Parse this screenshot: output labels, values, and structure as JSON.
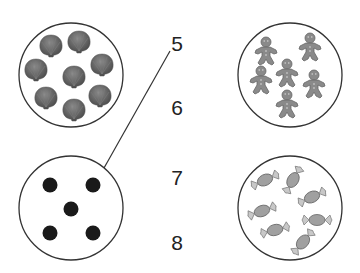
{
  "worksheet": {
    "groups": [
      {
        "id": "shells",
        "item": "seashell",
        "count": 8,
        "position": "top-left"
      },
      {
        "id": "gingerbread",
        "item": "gingerbread-man",
        "count": 6,
        "position": "top-right"
      },
      {
        "id": "dots",
        "item": "dot",
        "count": 5,
        "position": "bottom-left"
      },
      {
        "id": "candies",
        "item": "wrapped-candy",
        "count": 7,
        "position": "bottom-right"
      }
    ],
    "numbers": [
      "5",
      "6",
      "7",
      "8"
    ],
    "connections": [
      {
        "from_group": "dots",
        "to_number": "5"
      }
    ],
    "colors": {
      "outline": "#333333",
      "shell": "#6e6e6e",
      "gingerbread": "#8a8a8a",
      "dot": "#1a1a1a",
      "candy": "#9a9a9a"
    }
  }
}
